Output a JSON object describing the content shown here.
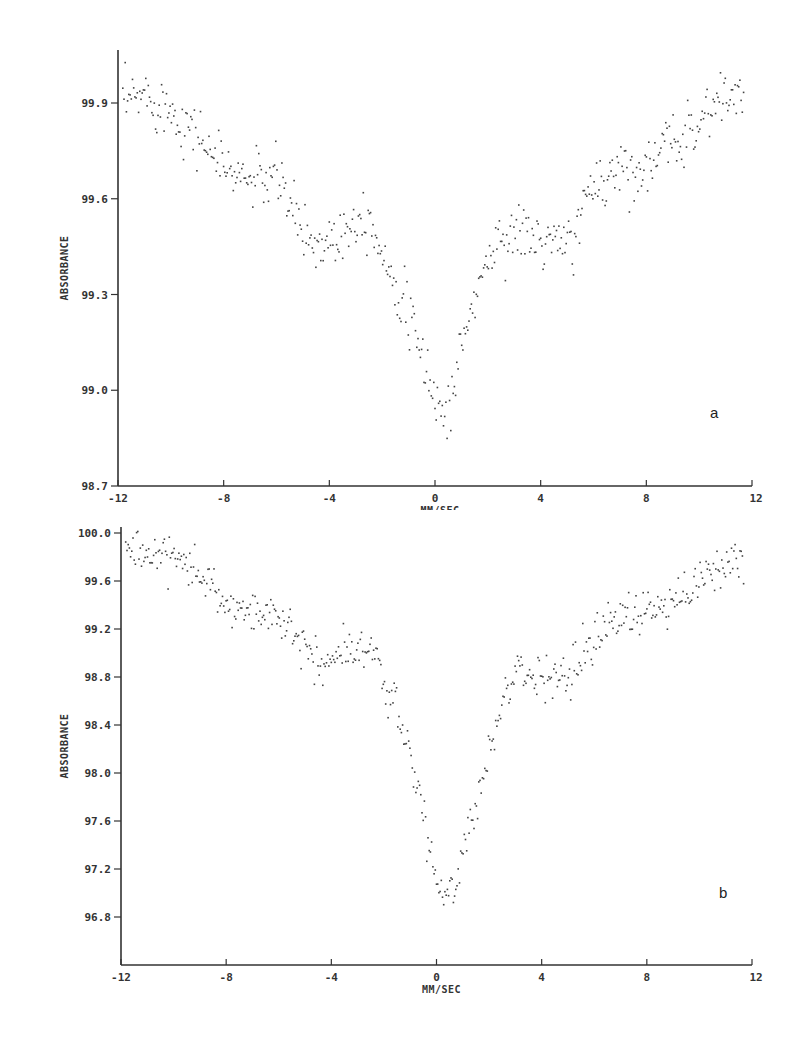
{
  "chart_data": [
    {
      "type": "scatter",
      "panel_label": "a",
      "title": "",
      "xlabel": "MM/SEC",
      "ylabel": "ABSORBANCE",
      "xlim": [
        -12,
        12
      ],
      "ylim": [
        98.7,
        100.05
      ],
      "x_ticks": [
        "-12",
        "-8",
        "-4",
        "0",
        "4",
        "8",
        "12"
      ],
      "y_ticks": [
        "99.9",
        "99.6",
        "99.3",
        "99.0",
        "98.7"
      ],
      "grid": false,
      "legend": null,
      "description": "Mossbauer spectrum: absorbance decreases from ~99.95 at -12 mm/s to a shoulder ~99.5 near -3 mm/s, sharp minimum ~98.9 near +0.3 mm/s, recovers to ~99.5 at 3-5 mm/s, rising to ~99.95 at +11 mm/s",
      "trend": {
        "x": [
          -11.8,
          -11,
          -10,
          -9,
          -8,
          -7,
          -6,
          -5.5,
          -5,
          -4.5,
          -4,
          -3.5,
          -3,
          -2.5,
          -2,
          -1.5,
          -1,
          -0.5,
          0,
          0.3,
          0.6,
          1,
          1.5,
          2,
          2.5,
          3,
          4,
          5,
          5.5,
          6,
          7,
          8,
          9,
          10,
          11,
          11.6
        ],
        "y": [
          99.9,
          99.93,
          99.88,
          99.8,
          99.7,
          99.66,
          99.67,
          99.58,
          99.5,
          99.45,
          99.48,
          99.5,
          99.55,
          99.55,
          99.42,
          99.35,
          99.22,
          99.1,
          98.98,
          98.92,
          98.98,
          99.15,
          99.3,
          99.42,
          99.48,
          99.5,
          99.47,
          99.45,
          99.55,
          99.65,
          99.7,
          99.7,
          99.78,
          99.85,
          99.93,
          99.92
        ]
      },
      "noise": 0.06
    },
    {
      "type": "scatter",
      "panel_label": "b",
      "title": "",
      "xlabel": "MM/SEC",
      "ylabel": "ABSORBANCE",
      "xlim": [
        -12,
        12
      ],
      "ylim": [
        96.4,
        100.0
      ],
      "x_ticks": [
        "-12",
        "-8",
        "-4",
        "0",
        "4",
        "8",
        "12"
      ],
      "y_ticks": [
        "100.0",
        "99.6",
        "99.2",
        "98.8",
        "98.4",
        "98.0",
        "97.6",
        "97.2",
        "96.8"
      ],
      "grid": false,
      "legend": null,
      "description": "Mossbauer spectrum: absorbance ~99.85 at -12 mm/s, step to ~99.3 near -7 mm/s, shoulder ~99.0 near -3 mm/s, sharp minimum ~96.9 near +0.4 mm/s, recovers to ~98.8 at 3-5 mm/s, rising to ~99.8 at +11 mm/s",
      "trend": {
        "x": [
          -11.8,
          -11,
          -10,
          -9,
          -8,
          -7,
          -6,
          -5,
          -4.5,
          -4,
          -3.5,
          -3,
          -2.5,
          -2,
          -1.5,
          -1,
          -0.5,
          0,
          0.3,
          0.6,
          1,
          1.5,
          2,
          2.5,
          3,
          4,
          5,
          6,
          7,
          8,
          9,
          10,
          11,
          11.6
        ],
        "y": [
          99.85,
          99.82,
          99.78,
          99.65,
          99.42,
          99.35,
          99.3,
          99.05,
          98.9,
          98.95,
          99.0,
          99.05,
          99.05,
          98.75,
          98.45,
          98.1,
          97.6,
          97.05,
          96.9,
          96.95,
          97.4,
          97.75,
          98.2,
          98.6,
          98.82,
          98.8,
          98.8,
          99.15,
          99.3,
          99.35,
          99.4,
          99.6,
          99.75,
          99.8
        ]
      },
      "noise": 0.12
    }
  ]
}
